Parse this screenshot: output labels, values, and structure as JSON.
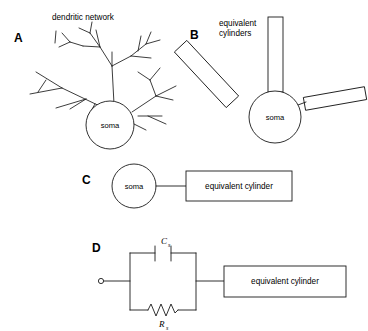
{
  "figure": {
    "background_color": "#ffffff",
    "stroke_color": "#1a1a1a",
    "panels": [
      {
        "letter": "A",
        "caption": "dendritic network",
        "soma_label": "soma",
        "description": "branching dendritic tree converging on a circular soma"
      },
      {
        "letter": "B",
        "caption": "equivalent\ncylinders",
        "caption_line1": "equivalent",
        "caption_line2": "cylinders",
        "soma_label": "soma",
        "description": "three rectangular cylinders radiating from a circular soma"
      },
      {
        "letter": "C",
        "soma_label": "soma",
        "box_label": "equivalent cylinder",
        "description": "single soma circle connected to one equivalent cylinder box"
      },
      {
        "letter": "D",
        "capacitor_label": "C",
        "capacitor_subscript": "s",
        "resistor_label": "R",
        "resistor_subscript": "s",
        "box_label": "equivalent cylinder",
        "description": "RC circuit for soma in series with equivalent cylinder"
      }
    ]
  }
}
